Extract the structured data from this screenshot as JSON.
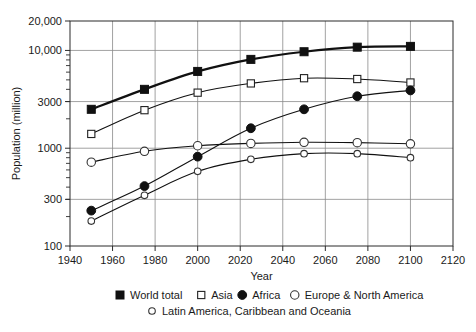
{
  "chart_data": {
    "type": "line",
    "title": "",
    "xlabel": "Year",
    "ylabel": "Population (million)",
    "yscale": "log",
    "ylim": [
      100,
      20000
    ],
    "xlim": [
      1940,
      2120
    ],
    "grid": true,
    "legend_position": "bottom",
    "x": [
      1950,
      1975,
      2000,
      2025,
      2050,
      2075,
      2100
    ],
    "xticks": [
      "1940",
      "1960",
      "1980",
      "2000",
      "2020",
      "2040",
      "2060",
      "2080",
      "2100",
      "2120"
    ],
    "xtick_values": [
      1940,
      1960,
      1980,
      2000,
      2020,
      2040,
      2060,
      2080,
      2100,
      2120
    ],
    "yticks": [
      "100",
      "300",
      "1000",
      "3000",
      "10,000",
      "20,000"
    ],
    "ytick_values": [
      100,
      300,
      1000,
      3000,
      10000,
      20000
    ],
    "series": [
      {
        "name": "World total",
        "marker": "filled-square",
        "values": [
          2500,
          4000,
          6100,
          8100,
          9700,
          10800,
          11000
        ]
      },
      {
        "name": "Asia",
        "marker": "open-square",
        "values": [
          1400,
          2450,
          3700,
          4600,
          5200,
          5100,
          4700
        ]
      },
      {
        "name": "Africa",
        "marker": "filled-circle",
        "values": [
          230,
          410,
          820,
          1600,
          2500,
          3400,
          3900
        ]
      },
      {
        "name": "Europe & North America",
        "marker": "open-circle",
        "values": [
          720,
          930,
          1060,
          1120,
          1150,
          1140,
          1110
        ]
      },
      {
        "name": "Latin America, Caribbean and Oceania",
        "marker": "open-circle-small",
        "values": [
          180,
          330,
          580,
          770,
          880,
          880,
          800
        ]
      }
    ]
  },
  "legend": {
    "rows": [
      [
        {
          "label": "World total",
          "marker": "filled-square"
        },
        {
          "label": "Asia",
          "marker": "open-square"
        },
        {
          "label": "Africa",
          "marker": "filled-circle"
        },
        {
          "label": "Europe & North America",
          "marker": "open-circle"
        }
      ],
      [
        {
          "label": "Latin America, Caribbean and Oceania",
          "marker": "open-circle-small"
        }
      ]
    ]
  }
}
